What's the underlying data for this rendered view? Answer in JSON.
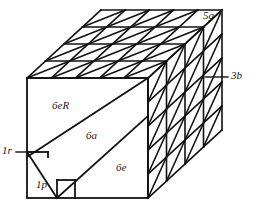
{
  "diagram": {
    "background_color": "#ffffff",
    "line_color": "#111111",
    "geometry": {
      "front_face": {
        "x0": 27,
        "y0": 78,
        "x1": 148,
        "y1": 198
      },
      "depth_vector": {
        "dx": 74,
        "dy": -68
      },
      "top_face_cols": 5,
      "top_face_rows": 4,
      "right_face_cols": 4,
      "right_face_rows": 5
    },
    "labels": {
      "top_right_cell": "5g",
      "right_face_callout": "3b",
      "left_callout": "1r",
      "bottom_left_region": "1p",
      "front_upper_region": "6eR",
      "front_band_region": "6a",
      "front_lower_region": "6e"
    }
  }
}
